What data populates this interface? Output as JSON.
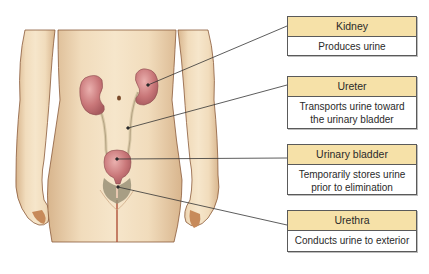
{
  "figure": {
    "colors": {
      "label_header_bg": "#f6e1a8",
      "label_border": "#5a5a5a",
      "skin": "#efd9b8",
      "skin_shadow": "#d9b892",
      "organ": "#c9767a",
      "organ_highlight": "#e7a4a4",
      "leader_line": "#333333"
    }
  },
  "labels": [
    {
      "title": "Kidney",
      "description": "Produces urine"
    },
    {
      "title": "Ureter",
      "description": "Transports urine toward the urinary bladder"
    },
    {
      "title": "Urinary bladder",
      "description": "Temporarily stores urine prior to elimination"
    },
    {
      "title": "Urethra",
      "description": "Conducts urine to exterior"
    }
  ],
  "label_lines": {
    "ureter": [
      "Transports urine toward",
      "the urinary bladder"
    ],
    "bladder": [
      "Temporarily stores urine",
      "prior to elimination"
    ]
  }
}
